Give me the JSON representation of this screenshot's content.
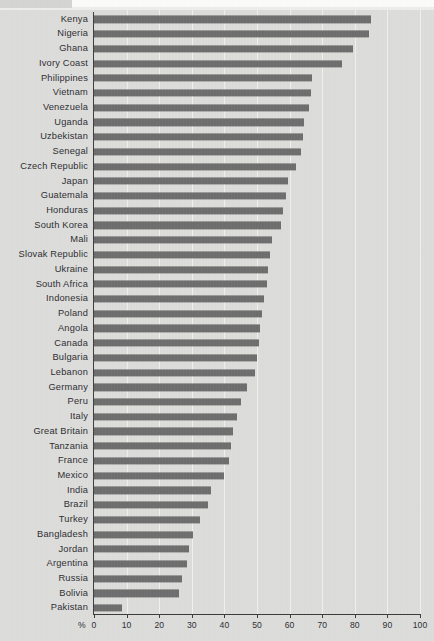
{
  "chart_data": {
    "type": "bar",
    "orientation": "horizontal",
    "title": "",
    "xlabel": "%",
    "ylabel": "",
    "xlim": [
      0,
      100
    ],
    "xticks": [
      0,
      10,
      20,
      30,
      40,
      50,
      60,
      70,
      80,
      90,
      100
    ],
    "xtick_labels": [
      "0",
      "10",
      "20",
      "30",
      "40",
      "50",
      "60",
      "70",
      "80",
      "90",
      "100"
    ],
    "grid": true,
    "legend": "none",
    "bar_color": "#6e6e6e",
    "background_color": "#dcdcda",
    "categories": [
      "Kenya",
      "Nigeria",
      "Ghana",
      "Ivory Coast",
      "Philippines",
      "Vietnam",
      "Venezuela",
      "Uganda",
      "Uzbekistan",
      "Senegal",
      "Czech Republic",
      "Japan",
      "Guatemala",
      "Honduras",
      "South Korea",
      "Mali",
      "Slovak Republic",
      "Ukraine",
      "South Africa",
      "Indonesia",
      "Poland",
      "Angola",
      "Canada",
      "Bulgaria",
      "Lebanon",
      "Germany",
      "Peru",
      "Italy",
      "Great Britain",
      "Tanzania",
      "France",
      "Mexico",
      "India",
      "Brazil",
      "Turkey",
      "Bangladesh",
      "Jordan",
      "Argentina",
      "Russia",
      "Bolivia",
      "Pakistan"
    ],
    "values": [
      85,
      84.5,
      79.5,
      76,
      67,
      66.5,
      66,
      64.5,
      64,
      63.5,
      62,
      59.5,
      59,
      58,
      57.5,
      54.5,
      54,
      53.5,
      53,
      52,
      51.5,
      51,
      50.5,
      50,
      49.5,
      47,
      45,
      44,
      42.5,
      42,
      41.5,
      40,
      36,
      35,
      32.5,
      30.5,
      29,
      28.5,
      27,
      26,
      8.5
    ]
  }
}
